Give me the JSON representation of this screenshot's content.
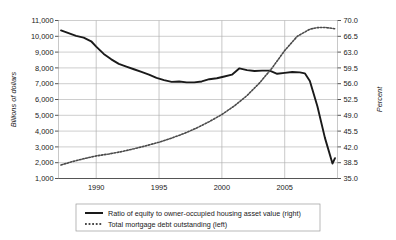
{
  "chart_data": {
    "type": "line",
    "title": "",
    "xlabel": "",
    "ylabel": "Billions of dollars",
    "y2label": "Percent",
    "grid": true,
    "legend_position": "bottom",
    "xlim": [
      1987.0,
      2009.2
    ],
    "ylim": [
      1000,
      11000
    ],
    "y2lim": [
      35.0,
      70.0
    ],
    "xticks": [
      "1990",
      "1995",
      "2000",
      "2005"
    ],
    "xtick_values": [
      1990,
      1995,
      2000,
      2005
    ],
    "yticks": [
      "1,000",
      "2,000",
      "3,000",
      "4,000",
      "5,000",
      "6,000",
      "7,000",
      "8,000",
      "9,000",
      "10,000",
      "11,000"
    ],
    "ytick_values": [
      1000,
      2000,
      3000,
      4000,
      5000,
      6000,
      7000,
      8000,
      9000,
      10000,
      11000
    ],
    "y2ticks": [
      "35.0",
      "38.5",
      "42.0",
      "45.5",
      "49.0",
      "52.5",
      "56.0",
      "59.5",
      "63.0",
      "66.5",
      "70.0"
    ],
    "y2tick_values": [
      35.0,
      38.5,
      42.0,
      45.5,
      49.0,
      52.5,
      56.0,
      59.5,
      63.0,
      66.5,
      70.0
    ],
    "series": [
      {
        "name": "Ratio of equity to owner-occupied housing asset value (right)",
        "axis": "right",
        "style": "solid",
        "color": "#1a1a1a",
        "x": [
          1987.2,
          1987.8,
          1988.4,
          1989.0,
          1989.6,
          1990.0,
          1990.6,
          1991.2,
          1991.8,
          1992.4,
          1993.0,
          1993.6,
          1994.2,
          1994.8,
          1995.4,
          1996.0,
          1996.6,
          1997.2,
          1997.8,
          1998.4,
          1999.0,
          1999.6,
          2000.2,
          2000.8,
          2001.4,
          2002.0,
          2002.6,
          2003.2,
          2003.8,
          2004.4,
          2005.0,
          2005.6,
          2006.2,
          2006.6,
          2007.0,
          2007.6,
          2008.2,
          2008.8,
          2009.0
        ],
        "y": [
          67.8,
          67.2,
          66.6,
          66.2,
          65.4,
          64.2,
          62.6,
          61.4,
          60.4,
          59.8,
          59.2,
          58.6,
          58.0,
          57.3,
          56.8,
          56.4,
          56.5,
          56.3,
          56.3,
          56.5,
          57.0,
          57.2,
          57.6,
          58.0,
          59.4,
          59.0,
          58.8,
          58.9,
          58.9,
          58.2,
          58.4,
          58.6,
          58.5,
          58.3,
          56.6,
          51.0,
          44.0,
          38.3,
          39.5
        ]
      },
      {
        "name": "Total mortgage debt outstanding (left)",
        "axis": "left",
        "style": "dotted",
        "color": "#4a4a4a",
        "x": [
          1987.2,
          1988.0,
          1989.0,
          1990.0,
          1991.0,
          1992.0,
          1993.0,
          1994.0,
          1995.0,
          1996.0,
          1997.0,
          1998.0,
          1999.0,
          2000.0,
          2001.0,
          2002.0,
          2003.0,
          2004.0,
          2005.0,
          2006.0,
          2007.0,
          2007.6,
          2008.2,
          2008.8,
          2009.0
        ],
        "y": [
          1850,
          2050,
          2250,
          2430,
          2550,
          2700,
          2880,
          3080,
          3300,
          3560,
          3850,
          4200,
          4600,
          5050,
          5600,
          6250,
          7050,
          8000,
          9100,
          10000,
          10450,
          10550,
          10560,
          10500,
          10480
        ]
      }
    ]
  },
  "legend": {
    "items": [
      {
        "label": "Ratio of equity to owner-occupied housing asset value (right)",
        "style": "solid"
      },
      {
        "label": "Total mortgage debt outstanding (left)",
        "style": "dotted"
      }
    ]
  }
}
